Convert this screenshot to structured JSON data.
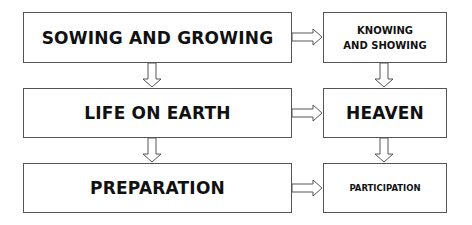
{
  "diagram": {
    "left_column": [
      {
        "id": "sowing",
        "label": "SOWING AND GROWING"
      },
      {
        "id": "life",
        "label": "LIFE ON EARTH"
      },
      {
        "id": "prep",
        "label": "PREPARATION"
      }
    ],
    "right_column": [
      {
        "id": "knowing",
        "label": "KNOWING AND SHOWING",
        "lines": [
          "KNOWING",
          "AND SHOWING"
        ]
      },
      {
        "id": "heaven",
        "label": "HEAVEN"
      },
      {
        "id": "participation",
        "label": "PARTICIPATION"
      }
    ],
    "edges": [
      {
        "from": "sowing",
        "to": "knowing",
        "direction": "right"
      },
      {
        "from": "life",
        "to": "heaven",
        "direction": "right"
      },
      {
        "from": "prep",
        "to": "participation",
        "direction": "right"
      },
      {
        "from": "sowing",
        "to": "life",
        "direction": "down"
      },
      {
        "from": "life",
        "to": "prep",
        "direction": "down"
      },
      {
        "from": "knowing",
        "to": "heaven",
        "direction": "down"
      },
      {
        "from": "heaven",
        "to": "participation",
        "direction": "down"
      }
    ],
    "colors": {
      "border": "#555555",
      "text": "#111111",
      "background": "#ffffff"
    }
  }
}
